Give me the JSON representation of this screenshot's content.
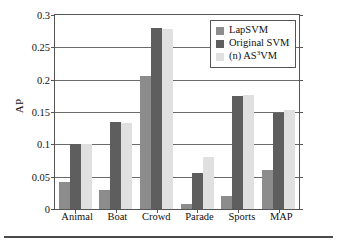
{
  "chart_data": {
    "type": "bar",
    "title": "",
    "xlabel": "",
    "ylabel": "AP",
    "categories": [
      "Animal",
      "Boat",
      "Crowd",
      "Parade",
      "Sports",
      "MAP"
    ],
    "series": [
      {
        "name": "LapSVM",
        "color": "#8c8c8c",
        "values": [
          0.042,
          0.029,
          0.206,
          0.008,
          0.02,
          0.06
        ]
      },
      {
        "name": "Original SVM",
        "color": "#5e5e5e",
        "values": [
          0.101,
          0.135,
          0.28,
          0.056,
          0.174,
          0.148
        ]
      },
      {
        "name": "(n) AS3VM",
        "color": "#e0e0e0",
        "values": [
          0.101,
          0.133,
          0.278,
          0.081,
          0.177,
          0.153
        ]
      }
    ],
    "ylim": [
      0,
      0.3
    ],
    "yticks": [
      "0",
      "0.05",
      "0.1",
      "0.15",
      "0.2",
      "0.25",
      "0.3"
    ],
    "ytick_values": [
      0,
      0.05,
      0.1,
      0.15,
      0.2,
      0.25,
      0.3
    ],
    "grid": true,
    "legend_position": "top-right"
  },
  "legend": {
    "entries": [
      {
        "label": "LapSVM",
        "label_prefix": "LapSVM",
        "superscript": "",
        "label_suffix": ""
      },
      {
        "label": "Original SVM",
        "label_prefix": "Original SVM",
        "superscript": "",
        "label_suffix": ""
      },
      {
        "label": "(n) AS3VM",
        "label_prefix": "(n) AS",
        "superscript": "3",
        "label_suffix": "VM"
      }
    ]
  },
  "colors": {
    "series1": "#8c8c8c",
    "series2": "#5e5e5e",
    "series3": "#e0e0e0",
    "axis": "#555555",
    "grid": "#6b6b6b",
    "text": "#111111"
  }
}
